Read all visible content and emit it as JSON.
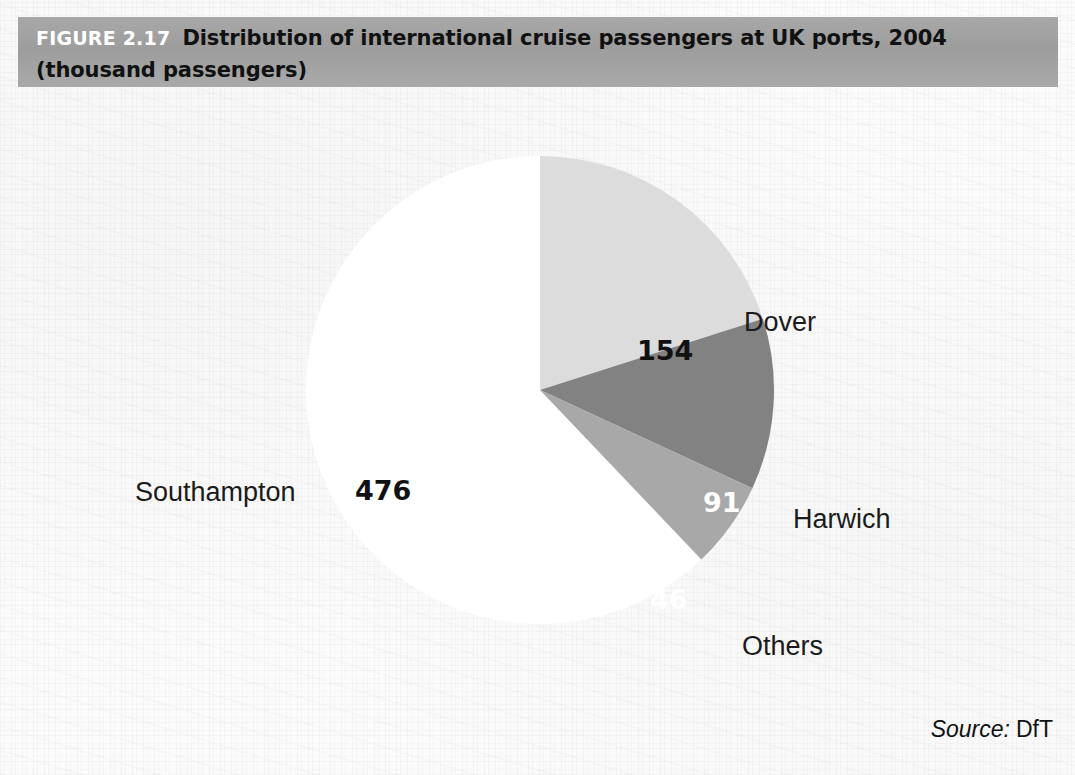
{
  "header": {
    "figure_label": "FIGURE 2.17",
    "title": "Distribution of international cruise passengers at UK ports, 2004",
    "subtitle": "(thousand passengers)",
    "bar_color": "#9d9d9d",
    "label_color": "#ffffff",
    "title_color": "#111111"
  },
  "source": {
    "label": "Source:",
    "value": "DfT"
  },
  "chart_data": {
    "type": "pie",
    "title": "Distribution of international cruise passengers at UK ports, 2004",
    "subtitle": "(thousand passengers)",
    "unit": "thousand passengers",
    "year": "2004",
    "categories": [
      "Southampton",
      "Dover",
      "Harwich",
      "Others"
    ],
    "values": [
      476,
      154,
      91,
      46
    ],
    "total": 767,
    "colors": [
      "#ffffff",
      "#dcdcdc",
      "#828282",
      "#a8a8a8"
    ],
    "label_colors": [
      "#111111",
      "#111111",
      "#ffffff",
      "#ffffff"
    ],
    "legend": "none",
    "grid": false,
    "slices": [
      {
        "name": "Southampton",
        "value": 476,
        "value_text": "476",
        "color": "#ffffff",
        "value_color": "#111111",
        "start_angle": 136.4,
        "end_angle": 360.0
      },
      {
        "name": "Dover",
        "value": 154,
        "value_text": "154",
        "color": "#dcdcdc",
        "value_color": "#111111",
        "start_angle": 0.0,
        "end_angle": 72.3
      },
      {
        "name": "Harwich",
        "value": 91,
        "value_text": "91",
        "color": "#828282",
        "value_color": "#ffffff",
        "start_angle": 72.3,
        "end_angle": 114.8
      },
      {
        "name": "Others",
        "value": 46,
        "value_text": "46",
        "color": "#a8a8a8",
        "value_color": "#ffffff",
        "start_angle": 114.8,
        "end_angle": 136.4
      }
    ]
  }
}
